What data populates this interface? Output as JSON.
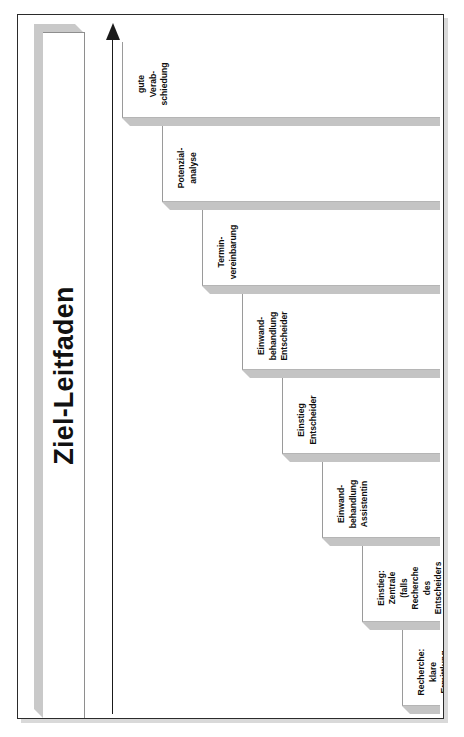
{
  "document": {
    "title": "Ziel-Leitfaden",
    "orientation": "landscape-rotated-90",
    "background_color": "#ffffff",
    "frame_color": "#2b2b2b",
    "step_fill_color": "#c4c4c4",
    "title_band_color": "#c9c9c9"
  },
  "axis": {
    "name": "progress-arrow",
    "direction": "right",
    "label": ""
  },
  "chart_data": {
    "type": "bar",
    "title": "Ziel-Leitfaden",
    "xlabel": "",
    "ylabel": "",
    "categories": [
      "Recherche: klare Ermittlung des Entscheiders",
      "Einstieg: Zentrale (falls Recherche des Entscheiders nicht erfolgreich), ansonsten Assistentin/Vorzimmer",
      "Einwand-behandlung Assistentin",
      "Einstieg Entscheider",
      "Einwand-behandlung Entscheider",
      "Termin-vereinbarung",
      "Potenzial-analyse",
      "gute Verab-schiedung"
    ],
    "values": [
      1,
      2,
      3,
      4,
      5,
      6,
      7,
      8
    ],
    "ylim": [
      0,
      8
    ],
    "grid": false,
    "legend": "none",
    "note": "Ascending staircase of sales-call phases; each step one level higher than the previous."
  },
  "steps": [
    {
      "index": 1,
      "label": "Recherche:\nklare\nErmittlung\ndes\nEntscheiders",
      "long": false
    },
    {
      "index": 2,
      "label": "Einstieg:\nZentrale\n(falls\nRecherche\ndes\nEntscheiders\nnicht\nerfolgreich),\nansonsten\nAssistentin/\nVorzimmer",
      "long": true
    },
    {
      "index": 3,
      "label": "Einwand-\nbehandlung\nAssistentin",
      "long": false
    },
    {
      "index": 4,
      "label": "Einstieg\nEntscheider",
      "long": false
    },
    {
      "index": 5,
      "label": "Einwand-\nbehandlung\nEntscheider",
      "long": false
    },
    {
      "index": 6,
      "label": "Termin-\nvereinbarung",
      "long": false
    },
    {
      "index": 7,
      "label": "Potenzial-\nanalyse",
      "long": false
    },
    {
      "index": 8,
      "label": "gute\nVerab-\nschiedung",
      "long": false
    }
  ]
}
